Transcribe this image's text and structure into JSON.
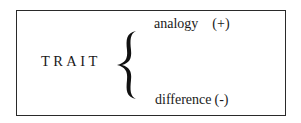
{
  "diagram": {
    "root": "TRAIT",
    "branches": [
      {
        "label": "analogy",
        "sign": "(+)"
      },
      {
        "label": "difference",
        "sign": "(-)"
      }
    ],
    "connector": "curly-brace"
  }
}
